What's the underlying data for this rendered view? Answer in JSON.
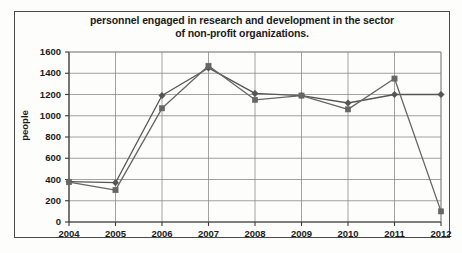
{
  "chart_data": {
    "type": "line",
    "title": "personnel engaged in research and development in the sector of non-profit organizations.",
    "title_line1": "personnel engaged in research and development in the sector",
    "title_line2": "of non-profit organizations.",
    "xlabel": "",
    "ylabel": "people",
    "categories": [
      "2004",
      "2005",
      "2006",
      "2007",
      "2008",
      "2009",
      "2010",
      "2011",
      "2012"
    ],
    "x": [
      2004,
      2005,
      2006,
      2007,
      2008,
      2009,
      2010,
      2011,
      2012
    ],
    "ylim": [
      0,
      1600
    ],
    "ytick_labels": [
      "0",
      "200",
      "400",
      "600",
      "800",
      "1000",
      "1200",
      "1400",
      "1600"
    ],
    "ytick_values": [
      0,
      200,
      400,
      600,
      800,
      1000,
      1200,
      1400,
      1600
    ],
    "grid": true,
    "legend": "none",
    "series": [
      {
        "name": "series-1",
        "marker": "diamond",
        "color": "#555555",
        "values": [
          380,
          370,
          1190,
          1450,
          1210,
          1190,
          1120,
          1200,
          1200
        ]
      },
      {
        "name": "series-2",
        "marker": "square",
        "color": "#666666",
        "values": [
          375,
          300,
          1070,
          1470,
          1150,
          1190,
          1060,
          1350,
          100
        ]
      }
    ]
  },
  "colors": {
    "frame": "#4a4a4a",
    "grid": "#8a8a8a",
    "axis": "#3a3a3a",
    "text": "#1b1b1b",
    "background": "#fdfdfc"
  }
}
